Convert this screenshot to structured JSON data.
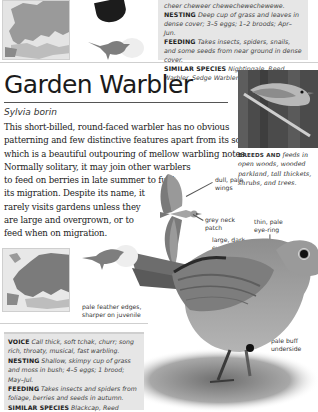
{
  "previous_species": {
    "info": {
      "voice_tail": "cheer cheweer chewechewechewewe.",
      "nesting_label": "NESTING",
      "nesting_text": "Deep cup of grass and leaves in dense cover; 3–5 eggs; 1–2 broods; Apr–Jun.",
      "feeding_label": "FEEDING",
      "feeding_text": "Takes insects, spiders, snails, and some seeds from near ground in dense cover.",
      "similar_label": "SIMILAR SPECIES",
      "similar_text": "Nightingale, Reed Warbler, Sedge Warbler."
    },
    "icons": {
      "map": "europe-range-map-icon",
      "silhouette": "bird-size-silhouette-icon"
    }
  },
  "species": {
    "common_name": "Garden Warbler",
    "latin_name": "Sylvia borin",
    "description_lines": [
      "This short-billed, round-faced warbler has no obvious",
      "patterning and few distinctive features apart from its song,",
      "which is a beautiful outpouring of mellow warbling notes.",
      "Normally solitary, it may join other warblers",
      "to feed on berries in late summer to fuel",
      "its migration. Despite its name, it",
      "rarely visits gardens unless they",
      "are large and overgrown, or to",
      "feed when on migration."
    ],
    "photo_caption": {
      "key": "BREEDS AND",
      "text": "feeds in open woods, wooded parkland, tall thickets, shrubs, and trees."
    },
    "labels": {
      "wings": "dull, pale wings",
      "neck": "grey neck patch",
      "eye_ring": "thin, pale eye-ring",
      "eyes": "large, dark eyes",
      "above": "pale buff-brown above",
      "feather_edges": "pale feather edges, sharper on juvenile",
      "underside": "pale buff underside"
    },
    "info": {
      "voice_label": "VOICE",
      "voice_text": "Call thick, soft tchak, churr; song rich, throaty, musical, fast warbling.",
      "nesting_label": "NESTING",
      "nesting_text": "Shallow, skimpy cup of grass and moss in bush; 4–5 eggs; 1 brood; May–Jul.",
      "feeding_label": "FEEDING",
      "feeding_text": "Takes insects and spiders from foliage, berries and seeds in autumn.",
      "similar_label": "SIMILAR SPECIES",
      "similar_text": "Blackcap, Reed Warbler, Spotted Flycatcher."
    },
    "icons": {
      "map": "europe-range-map-icon",
      "silhouette": "bird-size-silhouette-icon",
      "flight": "bird-in-flight-illustration",
      "main": "perched-bird-illustration",
      "photo": "bird-photo",
      "gender_symbol": "sex-symbol-icon"
    }
  },
  "colors": {
    "info_box_bg": "#e6e6e6",
    "title": "#1b1b1b",
    "map_fill": "#8a8a8a",
    "map_bg": "#e0e0e0"
  }
}
